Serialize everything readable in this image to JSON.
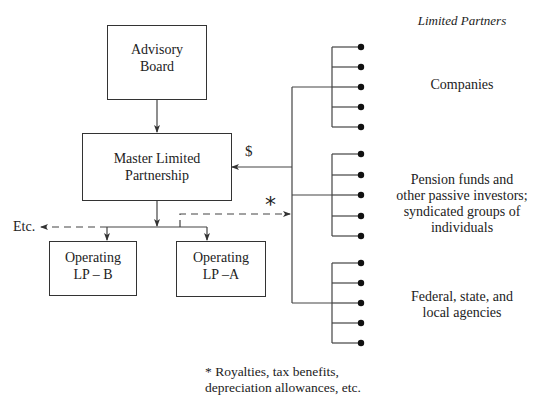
{
  "diagram": {
    "type": "organization-flow",
    "boxes": {
      "advisory_board": {
        "line1": "Advisory",
        "line2": "Board"
      },
      "mlp": {
        "line1": "Master Limited",
        "line2": "Partnership"
      },
      "lp_b": {
        "line1": "Operating",
        "line2": "LP – B"
      },
      "lp_a": {
        "line1": "Operating",
        "line2": "LP –A"
      }
    },
    "labels": {
      "etc": "Etc.",
      "dollar": "$",
      "asterisk": "*",
      "limited_partners_header": "Limited Partners"
    },
    "partner_groups": [
      {
        "name": "companies",
        "lines": [
          "Companies"
        ],
        "members": 5
      },
      {
        "name": "pension-funds",
        "lines": [
          "Pension funds and",
          "other passive investors;",
          "syndicated groups of",
          "individuals"
        ],
        "members": 5
      },
      {
        "name": "government-agencies",
        "lines": [
          "Federal, state, and",
          "local agencies"
        ],
        "members": 5
      }
    ],
    "footnote": {
      "line1": "* Royalties, tax benefits,",
      "line2": "depreciation allowances, etc."
    },
    "colors": {
      "line": "#444444",
      "dot": "#111111"
    }
  }
}
